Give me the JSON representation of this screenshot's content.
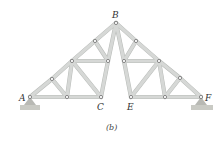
{
  "figure": {
    "caption": "(b)",
    "labels": {
      "A": "A",
      "B": "B",
      "C": "C",
      "E": "E",
      "F": "F"
    },
    "nodes": {
      "A": [
        30,
        97
      ],
      "B": [
        116,
        23
      ],
      "C": [
        101,
        97
      ],
      "E": [
        131,
        97
      ],
      "F": [
        201,
        97
      ],
      "L1": [
        52,
        79
      ],
      "L2": [
        72,
        61
      ],
      "L3": [
        95,
        41
      ],
      "L4": [
        108,
        61
      ],
      "L5": [
        67,
        97
      ],
      "R1": [
        136,
        41
      ],
      "R2": [
        124,
        61
      ],
      "R3": [
        159,
        61
      ],
      "R4": [
        180,
        78
      ],
      "R5": [
        165,
        97
      ]
    },
    "members": [
      [
        "A",
        "L1"
      ],
      [
        "L1",
        "L2"
      ],
      [
        "L2",
        "L3"
      ],
      [
        "L3",
        "B"
      ],
      [
        "A",
        "L5"
      ],
      [
        "L5",
        "C"
      ],
      [
        "L1",
        "L5"
      ],
      [
        "L5",
        "L2"
      ],
      [
        "L2",
        "C"
      ],
      [
        "L2",
        "L4"
      ],
      [
        "L3",
        "L4"
      ],
      [
        "L4",
        "B"
      ],
      [
        "L4",
        "C"
      ],
      [
        "B",
        "R1"
      ],
      [
        "R1",
        "R3"
      ],
      [
        "R3",
        "R4"
      ],
      [
        "R4",
        "F"
      ],
      [
        "E",
        "R5"
      ],
      [
        "R5",
        "F"
      ],
      [
        "B",
        "R2"
      ],
      [
        "R1",
        "R2"
      ],
      [
        "R2",
        "R3"
      ],
      [
        "R2",
        "E"
      ],
      [
        "E",
        "R3"
      ],
      [
        "R3",
        "R5"
      ],
      [
        "R5",
        "R4"
      ]
    ],
    "supports": [
      "A",
      "F"
    ]
  }
}
